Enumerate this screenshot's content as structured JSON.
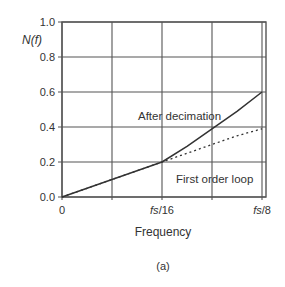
{
  "chart_data": {
    "type": "line",
    "title": "",
    "xlabel": "Frequency",
    "ylabel": "N(f)",
    "caption": "(a)",
    "x_ticks": [
      {
        "pos": 0,
        "label": "0"
      },
      {
        "pos": 0.5,
        "label": ""
      },
      {
        "pos": 1,
        "label": "fs/16"
      },
      {
        "pos": 1.5,
        "label": ""
      },
      {
        "pos": 2,
        "label": "fs/8"
      }
    ],
    "y_ticks": [
      "0.0",
      "0.2",
      "0.4",
      "0.6",
      "0.8",
      "1.0"
    ],
    "xlim": [
      0,
      2.08
    ],
    "ylim": [
      0,
      1.0
    ],
    "grid": true,
    "x_units": "multiples of fs/16",
    "x": [
      0,
      0.25,
      0.5,
      0.75,
      1.0,
      1.25,
      1.5,
      1.75,
      2.0
    ],
    "series": [
      {
        "name": "After decimation",
        "style": "solid",
        "values": [
          0.0,
          0.05,
          0.1,
          0.15,
          0.2,
          0.29,
          0.39,
          0.49,
          0.6
        ]
      },
      {
        "name": "First order loop",
        "style": "dotted",
        "values": [
          0.0,
          0.05,
          0.1,
          0.15,
          0.2,
          0.25,
          0.3,
          0.35,
          0.39
        ]
      }
    ],
    "annotations": [
      {
        "text": "After decimation",
        "x": 1.1,
        "y": 0.5
      },
      {
        "text": "First order loop",
        "x": 1.3,
        "y": 0.2
      }
    ],
    "colors": {
      "line": "#333333",
      "grid": "#555555"
    }
  }
}
